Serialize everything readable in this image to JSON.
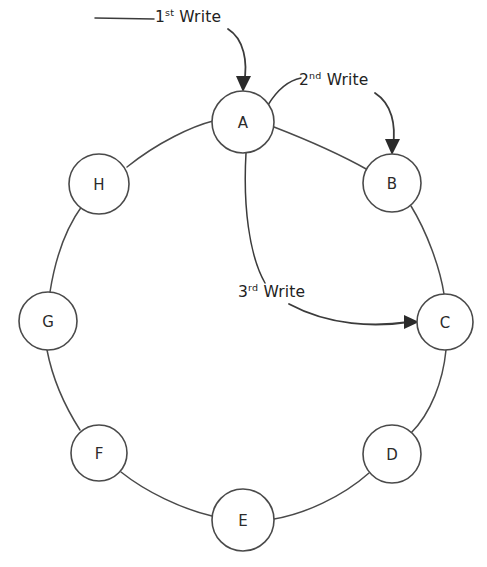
{
  "diagram": {
    "background_color": "#ffffff",
    "stroke_color": "#4a4a4a",
    "node_fill_color": "#ffffff",
    "label_color": "#222222",
    "nodes": [
      {
        "id": "A",
        "label": "A",
        "cx": 243,
        "cy": 122,
        "r": 31
      },
      {
        "id": "B",
        "label": "B",
        "cx": 392,
        "cy": 183,
        "r": 29
      },
      {
        "id": "C",
        "label": "C",
        "cx": 445,
        "cy": 322,
        "r": 28
      },
      {
        "id": "D",
        "label": "D",
        "cx": 392,
        "cy": 454,
        "r": 29
      },
      {
        "id": "E",
        "label": "E",
        "cx": 243,
        "cy": 520,
        "r": 31
      },
      {
        "id": "F",
        "label": "F",
        "cx": 99,
        "cy": 453,
        "r": 28
      },
      {
        "id": "G",
        "label": "G",
        "cx": 48,
        "cy": 321,
        "r": 29
      },
      {
        "id": "H",
        "label": "H",
        "cx": 99,
        "cy": 184,
        "r": 30
      }
    ],
    "edges": [
      {
        "from": "A",
        "to": "B"
      },
      {
        "from": "B",
        "to": "C"
      },
      {
        "from": "C",
        "to": "D"
      },
      {
        "from": "D",
        "to": "E"
      },
      {
        "from": "E",
        "to": "F"
      },
      {
        "from": "F",
        "to": "G"
      },
      {
        "from": "G",
        "to": "H"
      },
      {
        "from": "H",
        "to": "A"
      }
    ],
    "annotations": [
      {
        "id": "write-1",
        "ordinal": "1",
        "suffix": "st",
        "text": "Write",
        "full_text": "1st Write",
        "target_node": "A",
        "arrow_tip": {
          "x": 243,
          "y": 91
        }
      },
      {
        "id": "write-2",
        "ordinal": "2",
        "suffix": "nd",
        "text": "Write",
        "full_text": "2nd Write",
        "target_node": "B",
        "arrow_tip": {
          "x": 392,
          "y": 154
        }
      },
      {
        "id": "write-3",
        "ordinal": "3",
        "suffix": "rd",
        "text": "Write",
        "full_text": "3rd Write",
        "target_node": "C",
        "arrow_tip": {
          "x": 417,
          "y": 322
        }
      }
    ]
  }
}
